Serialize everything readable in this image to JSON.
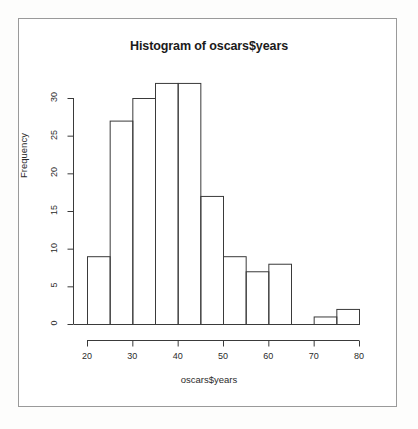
{
  "figure": {
    "title": "Histogram of oscars$years",
    "x_axis_label": "oscars$years",
    "y_axis_label": "Frequency",
    "frame_color": "#9a9a9a",
    "ink_color": "#3a3a3a",
    "background": "#ffffff"
  },
  "chart_data": {
    "type": "bar",
    "title": "Histogram of oscars$years",
    "xlabel": "oscars$years",
    "ylabel": "Frequency",
    "bin_width": 5,
    "bin_edges": [
      20,
      25,
      30,
      35,
      40,
      45,
      50,
      55,
      60,
      65,
      70,
      75,
      80
    ],
    "categories": [
      "20-25",
      "25-30",
      "30-35",
      "35-40",
      "40-45",
      "45-50",
      "50-55",
      "55-60",
      "60-65",
      "65-70",
      "70-75",
      "75-80"
    ],
    "values": [
      9,
      27,
      30,
      32,
      32,
      17,
      9,
      7,
      8,
      0,
      1,
      2
    ],
    "xlim": [
      20,
      80
    ],
    "ylim": [
      0,
      32
    ],
    "x_ticks": [
      20,
      30,
      40,
      50,
      60,
      70,
      80
    ],
    "y_ticks": [
      0,
      5,
      10,
      15,
      20,
      25,
      30
    ],
    "x_tick_labels": [
      "20",
      "30",
      "40",
      "50",
      "60",
      "70",
      "80"
    ],
    "y_tick_labels": [
      "0",
      "5",
      "10",
      "15",
      "20",
      "25",
      "30"
    ],
    "grid": false,
    "legend": null,
    "bar_fill": "none",
    "bar_border": "#3a3a3a"
  }
}
